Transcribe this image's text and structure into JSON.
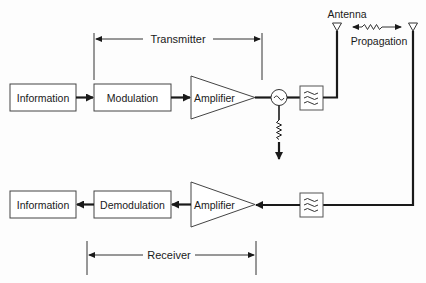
{
  "diagram": {
    "transmitter_label": "Transmitter",
    "receiver_label": "Receiver",
    "antenna_label": "Antenna",
    "propagation_label": "Propagation",
    "tx_chain": {
      "info_label": "Information",
      "modulation_label": "Modulation",
      "amplifier_label": "Amplifier"
    },
    "rx_chain": {
      "info_label": "Information",
      "demodulation_label": "Demodulation",
      "amplifier_label": "Amplifier"
    },
    "icons": {
      "oscillator": "oscillator-icon",
      "filter": "bandpass-filter-icon",
      "antenna": "antenna-icon",
      "load": "resistor-icon"
    },
    "colors": {
      "line": "#1a1a1a",
      "box_stroke": "#444444",
      "background": "#fdfdfd"
    }
  }
}
